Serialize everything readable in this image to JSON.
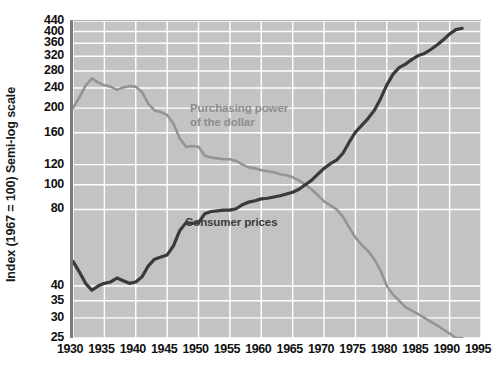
{
  "chart_data": {
    "type": "line",
    "title": "",
    "xlabel": "",
    "ylabel": "Index (1967 = 100) Semi-log scale",
    "yscale": "log",
    "ylim": [
      25,
      440
    ],
    "xlim": [
      1930,
      1995
    ],
    "grid": true,
    "legend_position": "inline-annotation",
    "background_color": "#c3c3c3",
    "gridline_color": "#ffffff",
    "y_ticks": [
      440,
      400,
      360,
      320,
      280,
      240,
      200,
      160,
      120,
      100,
      80,
      40,
      35,
      30,
      25
    ],
    "y_tick_labels": [
      "440",
      "400",
      "360",
      "320",
      "280",
      "240",
      "200",
      "160",
      "120",
      "100",
      "80",
      "40",
      "35",
      "30",
      "25"
    ],
    "x_ticks": [
      1930,
      1935,
      1940,
      1945,
      1950,
      1955,
      1960,
      1965,
      1970,
      1975,
      1980,
      1985,
      1990,
      1995
    ],
    "x_tick_labels": [
      "1930",
      "1935",
      "1940",
      "1945",
      "1950",
      "1955",
      "1960",
      "1965",
      "1970",
      "1975",
      "1980",
      "1985",
      "1990",
      "1995"
    ],
    "series": [
      {
        "name": "Purchasing power of the dollar",
        "label": "Purchasing power\nof the dollar",
        "color": "#949494",
        "x": [
          1930,
          1931,
          1932,
          1933,
          1934,
          1935,
          1936,
          1937,
          1938,
          1939,
          1940,
          1941,
          1942,
          1943,
          1944,
          1945,
          1946,
          1947,
          1948,
          1949,
          1950,
          1951,
          1952,
          1953,
          1954,
          1955,
          1956,
          1957,
          1958,
          1959,
          1960,
          1961,
          1962,
          1963,
          1964,
          1965,
          1966,
          1967,
          1968,
          1969,
          1970,
          1971,
          1972,
          1973,
          1974,
          1975,
          1976,
          1977,
          1978,
          1979,
          1980,
          1981,
          1982,
          1983,
          1984,
          1985,
          1986,
          1987,
          1988,
          1989,
          1990,
          1991,
          1992
        ],
        "values": [
          200,
          220,
          245,
          262,
          252,
          246,
          243,
          236,
          241,
          244,
          243,
          231,
          208,
          196,
          193,
          188,
          174,
          152,
          141,
          142,
          141,
          130,
          128,
          127,
          126,
          126,
          124,
          120,
          117,
          116,
          114,
          113,
          112,
          110,
          109,
          107,
          104,
          100,
          96,
          91,
          86,
          83,
          80,
          75,
          68,
          62,
          58,
          55,
          51,
          46,
          40,
          37,
          35,
          33,
          32,
          31,
          30,
          29,
          28,
          27,
          26,
          25,
          25
        ]
      },
      {
        "name": "Consumer prices",
        "label": "Consumer prices",
        "color": "#3a3a3a",
        "x": [
          1930,
          1931,
          1932,
          1933,
          1934,
          1935,
          1936,
          1937,
          1938,
          1939,
          1940,
          1941,
          1942,
          1943,
          1944,
          1945,
          1946,
          1947,
          1948,
          1949,
          1950,
          1951,
          1952,
          1953,
          1954,
          1955,
          1956,
          1957,
          1958,
          1959,
          1960,
          1961,
          1962,
          1963,
          1964,
          1965,
          1966,
          1967,
          1968,
          1969,
          1970,
          1971,
          1972,
          1973,
          1974,
          1975,
          1976,
          1977,
          1978,
          1979,
          1980,
          1981,
          1982,
          1983,
          1984,
          1985,
          1986,
          1987,
          1988,
          1989,
          1990,
          1991,
          1992
        ],
        "values": [
          50,
          45.5,
          41,
          38.5,
          40,
          41,
          41.5,
          43,
          42,
          41,
          41.5,
          43.5,
          48,
          51,
          52,
          53,
          57.5,
          66,
          71,
          70.5,
          71,
          77,
          78.5,
          79,
          79.5,
          79.5,
          80.5,
          83.5,
          85.5,
          86.5,
          88,
          88.5,
          89.5,
          90.5,
          92,
          93.5,
          96,
          100,
          104,
          110,
          116,
          121,
          125,
          133,
          147,
          161,
          171,
          182,
          196,
          218,
          247,
          272,
          289,
          298,
          311,
          322,
          328,
          340,
          354,
          371,
          391,
          407,
          412
        ]
      }
    ]
  }
}
